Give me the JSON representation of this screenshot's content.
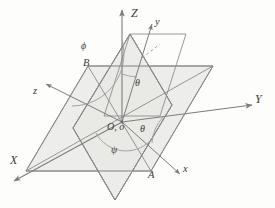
{
  "figure": {
    "colors": {
      "plane_fill": "#ececeb",
      "plane_fill_secondary": "#e6e6e4",
      "line": "#8a8a8a",
      "line_dark": "#6e6e6e",
      "label": "#3a3a3a",
      "background": "#fdfdfc"
    }
  },
  "axes": [
    {
      "id": "Z",
      "label": "Z",
      "kind": "fixed",
      "desc": "vertical fixed axis"
    },
    {
      "id": "Y",
      "label": "Y",
      "kind": "fixed",
      "desc": "horizontal fixed axis to the right"
    },
    {
      "id": "X",
      "label": "X",
      "kind": "fixed",
      "desc": "fixed axis toward lower left"
    },
    {
      "id": "z",
      "label": "z",
      "kind": "body",
      "desc": "body axis toward upper left"
    },
    {
      "id": "y",
      "label": "y",
      "kind": "body",
      "desc": "body axis toward upper right"
    },
    {
      "id": "x",
      "label": "x",
      "kind": "body",
      "desc": "body axis toward lower right"
    }
  ],
  "angles": [
    {
      "id": "phi",
      "label": "ϕ",
      "desc": "azimuthal angle arc at upper left between z axis and Z axis"
    },
    {
      "id": "theta_up",
      "label": "θ",
      "desc": "nutation angle between Z axis and y axis"
    },
    {
      "id": "theta_low",
      "label": "θ",
      "desc": "angle between Y axis and line of nodes toward A"
    },
    {
      "id": "psi",
      "label": "ψ",
      "desc": "spin angle arc below origin in the horizontal plane"
    }
  ],
  "points": [
    {
      "id": "origin",
      "label": "O, o",
      "desc": "common origin of both coordinate frames"
    },
    {
      "id": "A",
      "label": "A",
      "desc": "node point at lower right on the horizontal plane"
    },
    {
      "id": "B",
      "label": "B",
      "desc": "node point at upper left on the horizontal plane"
    }
  ],
  "planes": [
    {
      "id": "horizontal-plane",
      "desc": "fixed XY reference plane drawn as a shaded parallelogram"
    },
    {
      "id": "tilted-plane",
      "desc": "rotated xy body plane drawn as a shaded tilted parallelogram"
    }
  ]
}
